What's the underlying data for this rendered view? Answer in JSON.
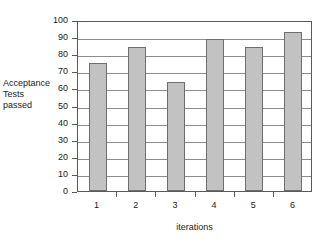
{
  "chart_data": {
    "type": "bar",
    "title": "",
    "categories": [
      "1",
      "2",
      "3",
      "4",
      "5",
      "6"
    ],
    "values": [
      75,
      84,
      64,
      89,
      84,
      93
    ],
    "series": [
      {
        "name": "Acceptance Tests passed",
        "values": [
          75,
          84,
          64,
          89,
          84,
          93
        ]
      }
    ],
    "xlabel": "iterations",
    "ylabel": "Acceptance Tests passed",
    "ylabel_lines": [
      "Acceptance",
      "Tests",
      "passed"
    ],
    "ylim": [
      0,
      100
    ],
    "yticks": [
      0,
      10,
      20,
      30,
      40,
      50,
      60,
      70,
      80,
      90,
      100
    ],
    "ytick_labels": [
      "0",
      "10",
      "20",
      "30",
      "40",
      "50",
      "60",
      "70",
      "80",
      "90",
      "100"
    ],
    "grid": true,
    "grid_axis": "y",
    "legend": false,
    "colors": {
      "bar_fill": "#c2c2c2",
      "bar_border": "#6e6e6e",
      "gridline": "#8c8c8c",
      "frame": "#5a5a5a",
      "background": "#ffffff",
      "text": "#1a1a1a"
    }
  }
}
